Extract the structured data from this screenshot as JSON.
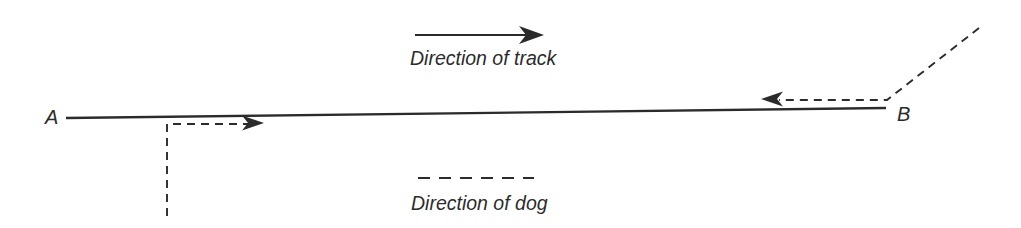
{
  "figure": {
    "background": "#ffffff",
    "ink_color": "#2b2b2b",
    "points": {
      "a": "A",
      "b": "B"
    },
    "labels": {
      "track_direction": "Direction of track",
      "dog_direction": "Direction of dog"
    }
  }
}
